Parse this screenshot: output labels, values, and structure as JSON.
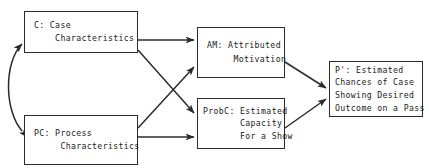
{
  "diagram": {
    "type": "flow-diagram",
    "background_color": "#ffffff",
    "line_color": "#2b2b2b",
    "text_color": "#1a1a1a",
    "nodes": [
      {
        "id": "C",
        "name": "case-characteristics",
        "lines": [
          "C: Case",
          "    Characteristics"
        ],
        "x": 24,
        "y": 11,
        "w": 114,
        "h": 42
      },
      {
        "id": "PC",
        "name": "process-characteristics",
        "lines": [
          "PC: Process",
          "     Characteristics"
        ],
        "x": 24,
        "y": 115,
        "w": 114,
        "h": 50
      },
      {
        "id": "AM",
        "name": "attributed-motivation",
        "lines": [
          "AM: Attributed",
          "     Motivation"
        ],
        "x": 197,
        "y": 27,
        "w": 88,
        "h": 51
      },
      {
        "id": "ProbC",
        "name": "estimated-capacity",
        "lines": [
          "ProbC: Estimated",
          "       Capacity",
          "       For a Show"
        ],
        "x": 197,
        "y": 98,
        "w": 88,
        "h": 51
      },
      {
        "id": "Pprime",
        "name": "estimated-chances",
        "lines": [
          "P': Estimated",
          "Chances of Case",
          "Showing Desired",
          "Outcome on a Pass"
        ],
        "x": 329,
        "y": 61,
        "w": 94,
        "h": 56
      }
    ],
    "edges": [
      {
        "name": "edge-c-to-am",
        "from": "C",
        "to": "AM",
        "style": "straight",
        "arrowheads": "single"
      },
      {
        "name": "edge-c-to-probc",
        "from": "C",
        "to": "ProbC",
        "style": "straight",
        "arrowheads": "single"
      },
      {
        "name": "edge-pc-to-am",
        "from": "PC",
        "to": "AM",
        "style": "straight",
        "arrowheads": "single"
      },
      {
        "name": "edge-pc-to-probc",
        "from": "PC",
        "to": "ProbC",
        "style": "straight",
        "arrowheads": "single"
      },
      {
        "name": "edge-am-to-pprime",
        "from": "AM",
        "to": "Pprime",
        "style": "straight",
        "arrowheads": "single"
      },
      {
        "name": "edge-probc-to-pprime",
        "from": "ProbC",
        "to": "Pprime",
        "style": "straight",
        "arrowheads": "single"
      },
      {
        "name": "edge-c-pc-bidirectional",
        "from": "C",
        "to": "PC",
        "style": "curved",
        "arrowheads": "double"
      }
    ]
  }
}
